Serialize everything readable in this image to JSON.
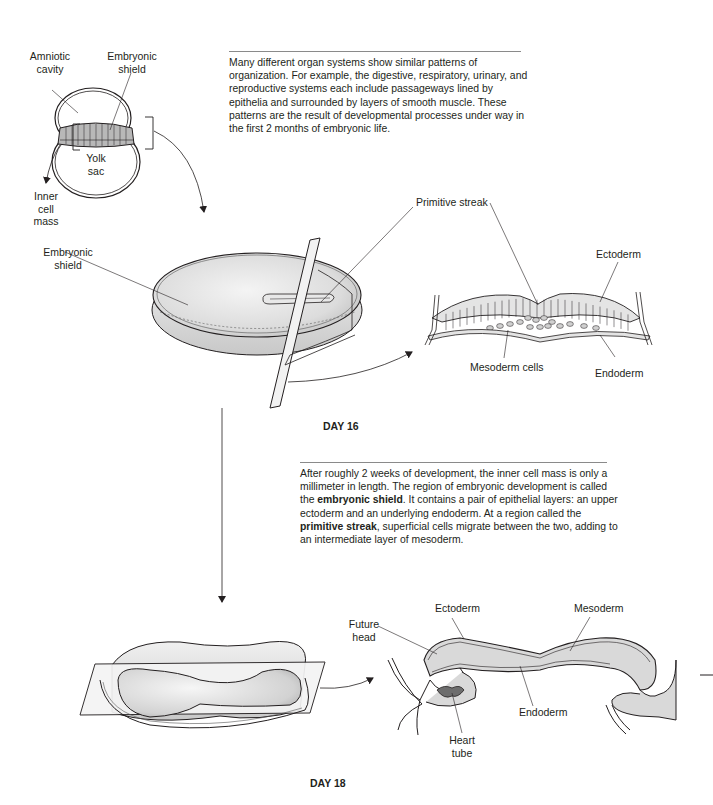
{
  "figure": {
    "intro_paragraph": "Many different organ systems show similar patterns of organization. For example, the digestive, respiratory, urinary, and reproductive systems each include passageways lined by epithelia and surrounded by layers of smooth muscle. These patterns are the result of developmental processes under way in the first 2 months of embryonic life.",
    "day16_paragraph": {
      "part1": "After roughly 2 weeks of development, the inner cell mass is only a millimeter in length. The region of embryonic development is called the ",
      "bold1": "embryonic shield",
      "part2": ". It contains a pair of epithelial layers: an upper ectoderm and an underlying endoderm. At a region called the ",
      "bold2": "primitive streak",
      "part3": ", superficial cells migrate between the two, adding to an intermediate layer of mesoderm."
    },
    "day16_caption": "DAY 16",
    "day18_caption": "DAY 18"
  },
  "blastocyst_labels": {
    "amniotic_cavity": [
      "Amniotic",
      "cavity"
    ],
    "embryonic_shield": [
      "Embryonic",
      "shield"
    ],
    "yolk_sac": [
      "Yolk",
      "sac"
    ],
    "inner_cell_mass": [
      "Inner",
      "cell",
      "mass"
    ]
  },
  "day16_labels": {
    "embryonic_shield": [
      "Embryonic",
      "shield"
    ],
    "primitive_streak": "Primitive streak",
    "ectoderm": "Ectoderm",
    "mesoderm_cells": "Mesoderm cells",
    "endoderm": "Endoderm"
  },
  "day18_labels": {
    "future_head": [
      "Future",
      "head"
    ],
    "ectoderm": "Ectoderm",
    "mesoderm": "Mesoderm",
    "endoderm": "Endoderm",
    "heart_tube": [
      "Heart",
      "tube"
    ]
  },
  "colors": {
    "tissue_fill": "#d9d9d9",
    "outline": "#231f20",
    "heart": "#6d6d6d"
  }
}
